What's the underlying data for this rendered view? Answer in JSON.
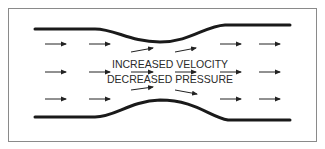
{
  "diagram": {
    "labels": {
      "line1": "INCREASED VELOCITY",
      "line2": "DECREASED PRESSURE"
    },
    "colors": {
      "frame": "#8a8a8a",
      "wall": "#1a1a1a",
      "arrow": "#222222",
      "text": "#2a2a2a",
      "background": "#ffffff"
    },
    "frame": {
      "x": 8,
      "y": 8,
      "width": 309,
      "height": 134
    },
    "top_wall": "M35,29 L95,29 C115,29 130,42 160,42 C190,42 205,26 225,25 L290,25",
    "bottom_wall": "M35,117 L95,117 C115,117 130,101 160,100 C195,100 210,117 228,120 L290,120",
    "arrows": [
      {
        "x1": 45,
        "y1": 44,
        "x2": 66,
        "y2": 44
      },
      {
        "x1": 89,
        "y1": 44,
        "x2": 110,
        "y2": 44
      },
      {
        "x1": 131,
        "y1": 52,
        "x2": 153,
        "y2": 48
      },
      {
        "x1": 175,
        "y1": 52,
        "x2": 196,
        "y2": 48
      },
      {
        "x1": 220,
        "y1": 44,
        "x2": 241,
        "y2": 44
      },
      {
        "x1": 259,
        "y1": 44,
        "x2": 280,
        "y2": 44
      },
      {
        "x1": 45,
        "y1": 72,
        "x2": 66,
        "y2": 72
      },
      {
        "x1": 89,
        "y1": 72,
        "x2": 110,
        "y2": 72
      },
      {
        "x1": 131,
        "y1": 72,
        "x2": 153,
        "y2": 72
      },
      {
        "x1": 175,
        "y1": 72,
        "x2": 196,
        "y2": 72
      },
      {
        "x1": 220,
        "y1": 72,
        "x2": 241,
        "y2": 72
      },
      {
        "x1": 259,
        "y1": 72,
        "x2": 280,
        "y2": 72
      },
      {
        "x1": 45,
        "y1": 99,
        "x2": 66,
        "y2": 99
      },
      {
        "x1": 89,
        "y1": 99,
        "x2": 110,
        "y2": 99
      },
      {
        "x1": 131,
        "y1": 90,
        "x2": 153,
        "y2": 87
      },
      {
        "x1": 175,
        "y1": 90,
        "x2": 197,
        "y2": 94
      },
      {
        "x1": 220,
        "y1": 99,
        "x2": 241,
        "y2": 99
      },
      {
        "x1": 259,
        "y1": 99,
        "x2": 280,
        "y2": 99
      }
    ]
  }
}
